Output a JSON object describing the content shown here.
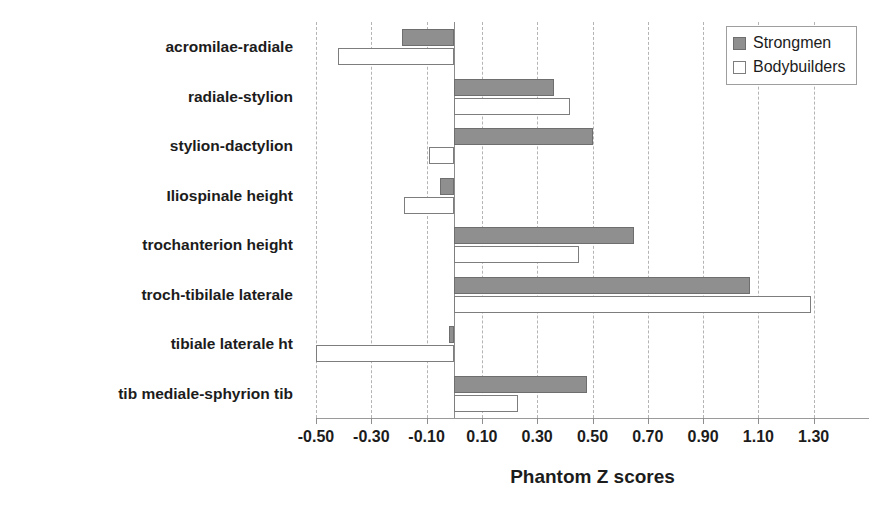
{
  "chart_data": {
    "type": "bar",
    "orientation": "horizontal",
    "title": "",
    "xlabel": "Phantom Z scores",
    "ylabel": "",
    "xlim": [
      -0.6,
      1.4
    ],
    "xticks": [
      -0.5,
      -0.3,
      -0.1,
      0.1,
      0.3,
      0.5,
      0.7,
      0.9,
      1.1,
      1.3
    ],
    "xticklabels": [
      "-0.50",
      "-0.30",
      "-0.10",
      "0.10",
      "0.30",
      "0.50",
      "0.70",
      "0.90",
      "1.10",
      "1.30"
    ],
    "grid": true,
    "grid_axis": "x",
    "legend_position": "top-right",
    "categories": [
      "acromilae-radiale",
      "radiale-stylion",
      "stylion-dactylion",
      "Iliospinale height",
      "trochanterion height",
      "troch-tibilale laterale",
      "tibiale laterale ht",
      "tib mediale-sphyrion tib"
    ],
    "series": [
      {
        "name": "Strongmen",
        "color": "#8f8f8f",
        "values": [
          -0.19,
          0.36,
          0.5,
          -0.05,
          0.65,
          1.07,
          -0.02,
          0.48
        ]
      },
      {
        "name": "Bodybuilders",
        "color": "#ffffff",
        "values": [
          -0.42,
          0.42,
          -0.09,
          -0.18,
          0.45,
          1.29,
          -0.5,
          0.23
        ]
      }
    ]
  },
  "legend": {
    "items": [
      {
        "label": "Strongmen",
        "swatch": "filled-gray-square"
      },
      {
        "label": "Bodybuilders",
        "swatch": "open-white-square"
      }
    ]
  },
  "axis": {
    "x_title": "Phantom Z scores"
  },
  "caption": {
    "top_clipped_text": ""
  }
}
